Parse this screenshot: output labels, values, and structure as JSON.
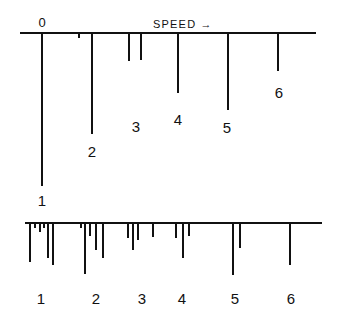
{
  "diagram": {
    "top_spectrum": {
      "axis_label": "SPEED →",
      "origin_label": "0",
      "baseline": {
        "y": 33,
        "x1": 20,
        "x2": 316
      },
      "lines": [
        {
          "x": 42,
          "y_end": 186,
          "label": "1",
          "label_x": 42,
          "label_y": 206
        },
        {
          "x": 79,
          "y_end": 38,
          "label": "",
          "label_x": 0,
          "label_y": 0
        },
        {
          "x": 92,
          "y_end": 134,
          "label": "2",
          "label_x": 92,
          "label_y": 157
        },
        {
          "x": 129,
          "y_end": 61,
          "label": "",
          "label_x": 0,
          "label_y": 0
        },
        {
          "x": 141,
          "y_end": 60,
          "label": "3",
          "label_x": 136,
          "label_y": 132
        },
        {
          "x": 178,
          "y_end": 93,
          "label": "4",
          "label_x": 178,
          "label_y": 125
        },
        {
          "x": 228,
          "y_end": 110,
          "label": "5",
          "label_x": 227,
          "label_y": 133
        },
        {
          "x": 278,
          "y_end": 71,
          "label": "6",
          "label_x": 279,
          "label_y": 98
        }
      ]
    },
    "bottom_spectrum": {
      "baseline": {
        "y": 223,
        "x1": 25,
        "x2": 322
      },
      "lines": [
        {
          "x": 30,
          "y_end": 262
        },
        {
          "x": 35,
          "y_end": 228
        },
        {
          "x": 40,
          "y_end": 232
        },
        {
          "x": 44,
          "y_end": 228
        },
        {
          "x": 48,
          "y_end": 258
        },
        {
          "x": 53,
          "y_end": 265
        },
        {
          "x": 81,
          "y_end": 228
        },
        {
          "x": 85,
          "y_end": 274
        },
        {
          "x": 90,
          "y_end": 236
        },
        {
          "x": 96,
          "y_end": 250
        },
        {
          "x": 103,
          "y_end": 258
        },
        {
          "x": 128,
          "y_end": 238
        },
        {
          "x": 133,
          "y_end": 250
        },
        {
          "x": 138,
          "y_end": 240
        },
        {
          "x": 153,
          "y_end": 237
        },
        {
          "x": 176,
          "y_end": 238
        },
        {
          "x": 183,
          "y_end": 258
        },
        {
          "x": 189,
          "y_end": 236
        },
        {
          "x": 233,
          "y_end": 275
        },
        {
          "x": 240,
          "y_end": 248
        },
        {
          "x": 290,
          "y_end": 265
        }
      ],
      "labels": [
        {
          "text": "1",
          "x": 41,
          "y": 304
        },
        {
          "text": "2",
          "x": 96,
          "y": 304
        },
        {
          "text": "3",
          "x": 142,
          "y": 304
        },
        {
          "text": "4",
          "x": 182,
          "y": 304
        },
        {
          "text": "5",
          "x": 235,
          "y": 304
        },
        {
          "text": "6",
          "x": 291,
          "y": 304
        }
      ]
    }
  }
}
